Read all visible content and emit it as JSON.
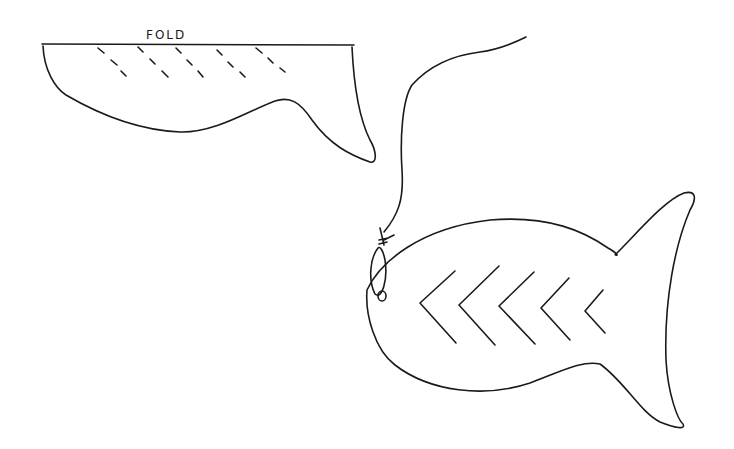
{
  "drawing": {
    "fold_template": {
      "label": "FOLD",
      "dashed_line_count": 5
    },
    "fish": {
      "chevron_count": 5,
      "has_hanging_string": true,
      "has_eye": true
    },
    "colors": {
      "ink": "#1a1a1a",
      "paper": "#ffffff"
    }
  }
}
